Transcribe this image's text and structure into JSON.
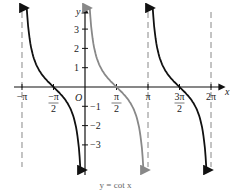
{
  "chart_data": {
    "type": "line",
    "title": "y = cot x",
    "xlabel": "x",
    "ylabel": "y",
    "origin_label": "O",
    "function": "cot(x)",
    "xlim": [
      -3.1416,
      6.2832
    ],
    "ylim": [
      -4,
      4
    ],
    "x_ticks": [
      {
        "value": -3.1416,
        "label": "−π"
      },
      {
        "value": -1.5708,
        "label": "−π/2"
      },
      {
        "value": 1.5708,
        "label": "π/2"
      },
      {
        "value": 3.1416,
        "label": "π"
      },
      {
        "value": 4.7124,
        "label": "3π/2"
      },
      {
        "value": 6.2832,
        "label": "2π"
      }
    ],
    "y_ticks": [
      3,
      2,
      1,
      -1,
      -2,
      -3
    ],
    "asymptotes": [
      -3.1416,
      0,
      3.1416,
      6.2832
    ],
    "series": [
      {
        "name": "branch (−π, 0)",
        "color": "#111111",
        "x_range": [
          -3.1416,
          0
        ],
        "zero": -1.5708
      },
      {
        "name": "branch (0, π)",
        "color": "#888888",
        "x_range": [
          0,
          3.1416
        ],
        "zero": 1.5708
      },
      {
        "name": "branch (π, 2π)",
        "color": "#111111",
        "x_range": [
          3.1416,
          6.2832
        ],
        "zero": 4.7124
      }
    ],
    "grid": false,
    "legend": "none"
  },
  "caption": "y = cot x"
}
